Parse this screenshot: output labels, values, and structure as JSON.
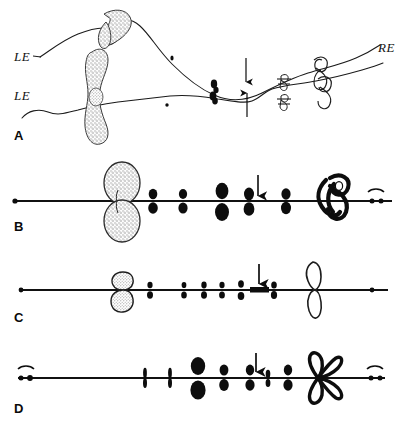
{
  "figure": {
    "type": "scientific-line-drawing",
    "background_color": "#ffffff",
    "ink_color": "#0d0d0d",
    "stipple_color": "#b9b9b9",
    "width": 409,
    "height": 428
  },
  "panels": [
    {
      "id": "A",
      "letter": "A",
      "letter_x": 14,
      "letter_y": 130,
      "labels": [
        {
          "name": "le-upper",
          "text": "LE",
          "x": 14,
          "y": 50
        },
        {
          "name": "le-lower",
          "text": "LE",
          "x": 14,
          "y": 89
        },
        {
          "name": "re-right",
          "text": "RE",
          "x": 380,
          "y": 48
        }
      ],
      "arrows": [
        {
          "name": "arrow-down",
          "x": 246,
          "y_top": 58,
          "y_bottom": 82,
          "dir": "down"
        },
        {
          "name": "arrow-up",
          "x": 247,
          "y_top": 93,
          "y_bottom": 117,
          "dir": "up"
        }
      ]
    },
    {
      "id": "B",
      "letter": "B",
      "letter_x": 14,
      "letter_y": 227,
      "axis_y": 201,
      "axis_x1": 14,
      "axis_x2": 392,
      "arrow": {
        "name": "arrow-marker-b",
        "x": 258,
        "y_top": 175,
        "y_bottom": 196
      },
      "nucleolus": {
        "name": "nucleolus-organizer",
        "x": 122,
        "y": 201,
        "rx": 19,
        "ry": 22,
        "fill": "stipple"
      },
      "knot": {
        "name": "terminal-knot",
        "x": 330,
        "y": 201
      },
      "telomere": {
        "name": "telomere-marker-right",
        "x": 376,
        "y": 201
      },
      "chromomeres": [
        {
          "x": 153,
          "size": 0.75
        },
        {
          "x": 183,
          "size": 0.72
        },
        {
          "x": 222,
          "size": 1.25
        },
        {
          "x": 249,
          "size": 0.95
        },
        {
          "x": 286,
          "size": 0.85
        }
      ]
    },
    {
      "id": "C",
      "letter": "C",
      "letter_x": 14,
      "letter_y": 319,
      "axis_y": 290,
      "axis_x1": 20,
      "axis_x2": 388,
      "arrow": {
        "name": "arrow-marker-c",
        "x": 259,
        "y_top": 264,
        "y_bottom": 284
      },
      "nucleolus": {
        "name": "nucleolus-organizer-open",
        "x": 123,
        "y": 290,
        "rx": 11,
        "ry": 16,
        "fill": "outline"
      },
      "bar": {
        "name": "dark-band",
        "x": 259,
        "y": 290,
        "w": 18,
        "h": 5
      },
      "knob": {
        "name": "terminal-knob-open",
        "x": 315,
        "y": 290
      },
      "telomere": {
        "name": "telomere-dot-right",
        "x": 372,
        "y": 290
      },
      "chromomeres": [
        {
          "x": 150,
          "size": 0.55
        },
        {
          "x": 184,
          "size": 0.5
        },
        {
          "x": 204,
          "size": 0.58
        },
        {
          "x": 222,
          "size": 0.55
        },
        {
          "x": 241,
          "size": 0.62
        },
        {
          "x": 274,
          "size": 0.6
        }
      ]
    },
    {
      "id": "D",
      "letter": "D",
      "letter_x": 14,
      "letter_y": 410,
      "axis_y": 378,
      "axis_x1": 18,
      "axis_x2": 385,
      "arrow": {
        "name": "arrow-marker-d",
        "x": 256,
        "y_top": 353,
        "y_bottom": 372
      },
      "telomere_left": {
        "name": "telomere-marker-left",
        "x": 24,
        "y": 378
      },
      "telomere_right": {
        "name": "telomere-marker-right",
        "x": 375,
        "y": 378
      },
      "knot": {
        "name": "terminal-cross-knot",
        "x": 318,
        "y": 378
      },
      "chromomeres": [
        {
          "x": 145,
          "size": 0.45
        },
        {
          "x": 170,
          "size": 0.45
        },
        {
          "x": 198,
          "size": 1.3
        },
        {
          "x": 224,
          "size": 0.8
        },
        {
          "x": 250,
          "size": 0.8
        },
        {
          "x": 268,
          "size": 0.5
        },
        {
          "x": 288,
          "size": 0.8
        }
      ]
    }
  ]
}
